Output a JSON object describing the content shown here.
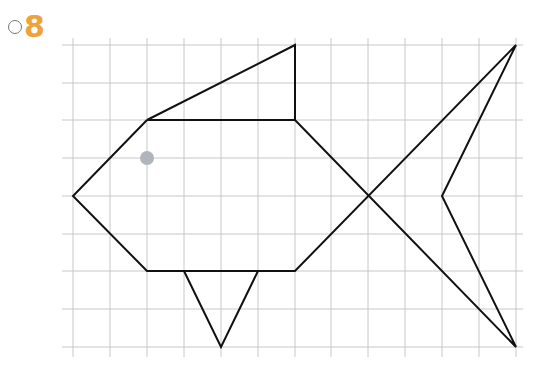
{
  "exercise": {
    "number": "8",
    "number_color": "#eea23a"
  },
  "grid": {
    "x_lines": [
      73,
      110,
      147,
      184,
      221,
      258,
      295,
      331,
      368,
      405,
      442,
      479,
      516
    ],
    "y_lines": [
      45,
      83,
      120,
      158,
      196,
      234,
      271,
      309,
      347
    ],
    "extent": {
      "x1": 62,
      "x2": 523,
      "y1": 38,
      "y2": 357
    },
    "color": "#c4c8cc"
  },
  "fish": {
    "stroke": "#111111",
    "polylines": [
      {
        "name": "dorsal-fin",
        "points": [
          [
            147,
            120
          ],
          [
            295,
            45
          ],
          [
            295,
            120
          ]
        ]
      },
      {
        "name": "body",
        "points": [
          [
            147,
            120
          ],
          [
            295,
            120
          ],
          [
            516,
            347
          ],
          [
            442,
            196
          ],
          [
            516,
            45
          ],
          [
            295,
            271
          ],
          [
            147,
            271
          ],
          [
            73,
            196
          ],
          [
            147,
            120
          ]
        ]
      },
      {
        "name": "ventral-fin",
        "points": [
          [
            184,
            271
          ],
          [
            221,
            347
          ],
          [
            258,
            271
          ]
        ]
      }
    ],
    "eye": {
      "cx": 147,
      "cy": 158,
      "r": 7,
      "color": "#b2b4bc"
    }
  }
}
